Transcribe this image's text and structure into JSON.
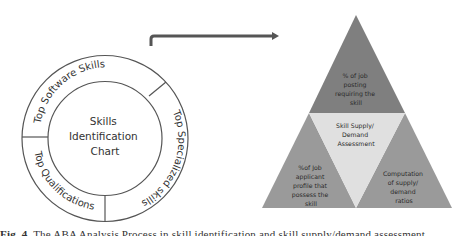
{
  "figure": {
    "colors": {
      "ring_stroke": "#555555",
      "ring_fill": "#ffffff",
      "arrow": "#555555",
      "pyramid_top": "#7f7f7f",
      "pyramid_left": "#9a9a9a",
      "pyramid_right": "#9a9a9a",
      "pyramid_center": "#e0e0e0",
      "text": "#333333"
    },
    "circle": {
      "center_title_line1": "Skills",
      "center_title_line2": "Identification",
      "center_title_line3": "Chart",
      "segments": [
        {
          "label": "Top Software Skills"
        },
        {
          "label": "Top Specialized skills"
        },
        {
          "label": "Top Qualifications"
        }
      ]
    },
    "pyramid": {
      "top": {
        "lines": [
          "% of job",
          "posting",
          "requiring the",
          "skill"
        ]
      },
      "center": {
        "lines": [
          "Skill Supply/",
          "Demand",
          "Assessment"
        ]
      },
      "left": {
        "lines": [
          "%of Job",
          "applicant",
          "profile that",
          "possess the",
          "skill"
        ]
      },
      "right": {
        "lines": [
          "Computation",
          "of supply/",
          "demand",
          "ratios"
        ]
      }
    }
  },
  "caption": {
    "label": "Fig. 4.",
    "text": "The ABA Analysis Process in skill identification and skill supply/demand assessment"
  }
}
